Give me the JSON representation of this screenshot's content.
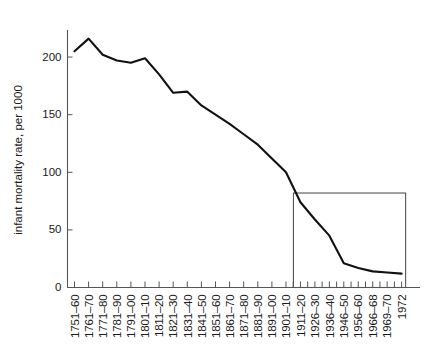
{
  "chart_data": {
    "type": "line",
    "title": "",
    "xlabel": "",
    "ylabel": "infant mortality rate, per 1000",
    "ylim": [
      0,
      230
    ],
    "yticks": [
      0,
      50,
      100,
      150,
      200
    ],
    "ytick_labels": [
      "0",
      "50",
      "100",
      "150",
      "200"
    ],
    "grid": false,
    "legend": "none",
    "categories": [
      "1751–60",
      "1761–70",
      "1771–80",
      "1781–90",
      "1791–00",
      "1801–10",
      "1811–20",
      "1821–30",
      "1831–40",
      "1841–50",
      "1851–60",
      "1861–70",
      "1871–80",
      "1881–90",
      "1891–00",
      "1901–10",
      "1911–20",
      "1926–30",
      "1936–40",
      "1946–50",
      "1956–60",
      "1966–68",
      "1969–70",
      "1972"
    ],
    "values": [
      205,
      216,
      202,
      197,
      195,
      199,
      185,
      169,
      170,
      158,
      150,
      142,
      133,
      124,
      112,
      100,
      74,
      59,
      45,
      21,
      17,
      14,
      13,
      12
    ],
    "annotations": [
      {
        "name": "inset-highlight-box",
        "type": "rectangle",
        "x_start_category": "1911–20",
        "x_end_category": "1972",
        "y_top": 82,
        "y_bottom": 0
      }
    ]
  },
  "axis": {
    "y_title": "infant mortality rate, per 1000",
    "y_tick_labels": [
      "200",
      "150",
      "100",
      "50",
      "0"
    ],
    "x_tick_labels": [
      "1751–60",
      "1761–70",
      "1771–80",
      "1781–90",
      "1791–00",
      "1801–10",
      "1811–20",
      "1821–30",
      "1831–40",
      "1841–50",
      "1851–60",
      "1861–70",
      "1871–80",
      "1881–90",
      "1891–00",
      "1901–10",
      "1911–20",
      "1926–30",
      "1936–40",
      "1946–50",
      "1956–60",
      "1966–68",
      "1969–70",
      "1972"
    ]
  },
  "colors": {
    "line": "#111111",
    "axis": "#555555",
    "background": "#ffffff",
    "text": "#1a1a1a"
  }
}
